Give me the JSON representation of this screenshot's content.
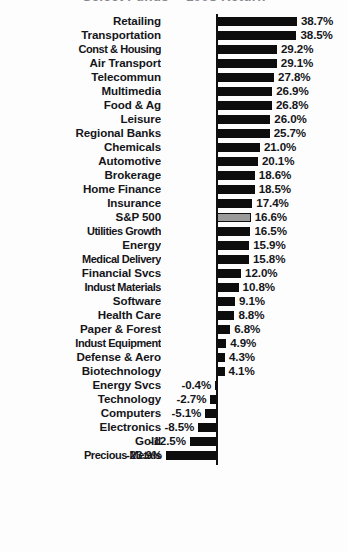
{
  "chart_data": {
    "type": "bar",
    "orientation": "horizontal",
    "title": "Select Funds -- 1998 Return",
    "title_clipped": true,
    "xlabel": "",
    "ylabel": "",
    "value_suffix": "%",
    "xlim": [
      -23.9,
      38.7
    ],
    "grid": false,
    "legend": false,
    "highlight_category": "S&P 500",
    "highlight_color": "#9b9b9b",
    "bar_color": "#0d0d0d",
    "categories": [
      "Retailing",
      "Transportation",
      "Const & Housing",
      "Air Transport",
      "Telecommun",
      "Multimedia",
      "Food & Ag",
      "Leisure",
      "Regional Banks",
      "Chemicals",
      "Automotive",
      "Brokerage",
      "Home Finance",
      "Insurance",
      "S&P 500",
      "Utilities Growth",
      "Energy",
      "Medical Delivery",
      "Financial Svcs",
      "Indust Materials",
      "Software",
      "Health Care",
      "Paper & Forest",
      "Indust Equipment",
      "Defense & Aero",
      "Biotechnology",
      "Energy Svcs",
      "Technology",
      "Computers",
      "Electronics",
      "Gold",
      "Precious Metals"
    ],
    "values": [
      38.7,
      38.5,
      29.2,
      29.1,
      27.8,
      26.9,
      26.8,
      26.0,
      25.7,
      21.0,
      20.1,
      18.6,
      18.5,
      17.4,
      16.6,
      16.5,
      15.9,
      15.8,
      12.0,
      10.8,
      9.1,
      8.8,
      6.8,
      4.9,
      4.3,
      4.1,
      -0.4,
      -2.7,
      -5.1,
      -8.5,
      -12.5,
      -23.9
    ],
    "value_labels": [
      "38.7%",
      "38.5%",
      "29.2%",
      "29.1%",
      "27.8%",
      "26.9%",
      "26.8%",
      "26.0%",
      "25.7%",
      "21.0%",
      "20.1%",
      "18.6%",
      "18.5%",
      "17.4%",
      "16.6%",
      "16.5%",
      "15.9%",
      "15.8%",
      "12.0%",
      "10.8%",
      "9.1%",
      "8.8%",
      "6.8%",
      "4.9%",
      "4.3%",
      "4.1%",
      "-0.4%",
      "-2.7%",
      "-5.1%",
      "-8.5%",
      "-12.5%",
      "-23.9%"
    ]
  },
  "layout": {
    "zero_axis_x": 216,
    "px_per_percent": 2.09,
    "row_height": 14,
    "bar_height": 9,
    "top_offset": 14,
    "label_column_width": 161
  }
}
